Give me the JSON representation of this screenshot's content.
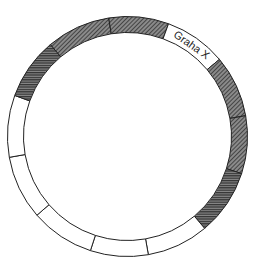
{
  "diagram": {
    "type": "segmented-ring",
    "center": [
      127.5,
      136.5
    ],
    "outer_radius": 120,
    "inner_radius": 104,
    "colors": {
      "stroke": "#222222",
      "hatch_dark": "#3a3a3a",
      "hatch_bg": "#888888",
      "empty": "#ffffff"
    },
    "segments": [
      {
        "start": -40,
        "end": -9,
        "fill": "hatched",
        "pattern": "diag",
        "label": ""
      },
      {
        "start": -9,
        "end": 20,
        "fill": "hatched",
        "pattern": "diag",
        "label": ""
      },
      {
        "start": 20,
        "end": 50,
        "fill": "empty",
        "pattern": "",
        "label": "Graha X"
      },
      {
        "start": 50,
        "end": 80,
        "fill": "hatched",
        "pattern": "diag",
        "label": ""
      },
      {
        "start": 80,
        "end": 108,
        "fill": "hatched",
        "pattern": "diag",
        "label": ""
      },
      {
        "start": 108,
        "end": 140,
        "fill": "hatched",
        "pattern": "horiz",
        "label": ""
      },
      {
        "start": 140,
        "end": 170,
        "fill": "empty",
        "pattern": "",
        "label": ""
      },
      {
        "start": 170,
        "end": 198,
        "fill": "empty",
        "pattern": "",
        "label": ""
      },
      {
        "start": 198,
        "end": 229,
        "fill": "empty",
        "pattern": "",
        "label": ""
      },
      {
        "start": 229,
        "end": 260,
        "fill": "empty",
        "pattern": "",
        "label": ""
      },
      {
        "start": 260,
        "end": 290,
        "fill": "empty",
        "pattern": "",
        "label": ""
      },
      {
        "start": 290,
        "end": 320,
        "fill": "hatched",
        "pattern": "horiz",
        "label": ""
      }
    ]
  }
}
